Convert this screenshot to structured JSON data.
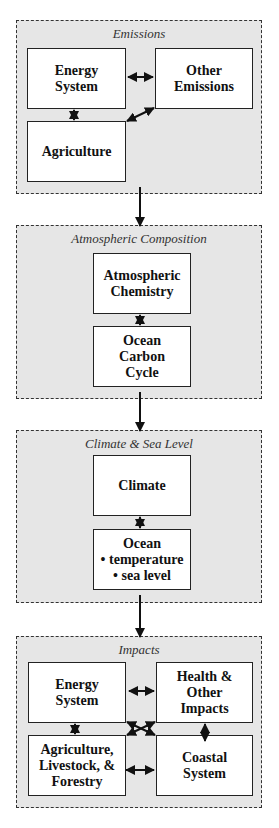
{
  "panels": [
    {
      "title": "Emissions",
      "boxes": {
        "energy": [
          "Energy",
          "System"
        ],
        "other": [
          "Other",
          "Emissions"
        ],
        "agriculture": [
          "Agriculture"
        ]
      }
    },
    {
      "title": "Atmospheric Composition",
      "boxes": {
        "chemistry": [
          "Atmospheric",
          "Chemistry"
        ],
        "ocean_carbon": [
          "Ocean",
          "Carbon",
          "Cycle"
        ]
      }
    },
    {
      "title": "Climate & Sea Level",
      "boxes": {
        "climate": [
          "Climate"
        ],
        "ocean": [
          "Ocean",
          "• temperature",
          "• sea level"
        ]
      }
    },
    {
      "title": "Impacts",
      "boxes": {
        "energy": [
          "Energy",
          "System"
        ],
        "health": [
          "Health &",
          "Other",
          "Impacts"
        ],
        "agriculture": [
          "Agriculture,",
          "Livestock, &",
          "Forestry"
        ],
        "coastal": [
          "Coastal",
          "System"
        ]
      }
    }
  ],
  "colors": {
    "panel_bg": "#e6e6e6",
    "box_bg": "#ffffff",
    "line": "#111111"
  }
}
